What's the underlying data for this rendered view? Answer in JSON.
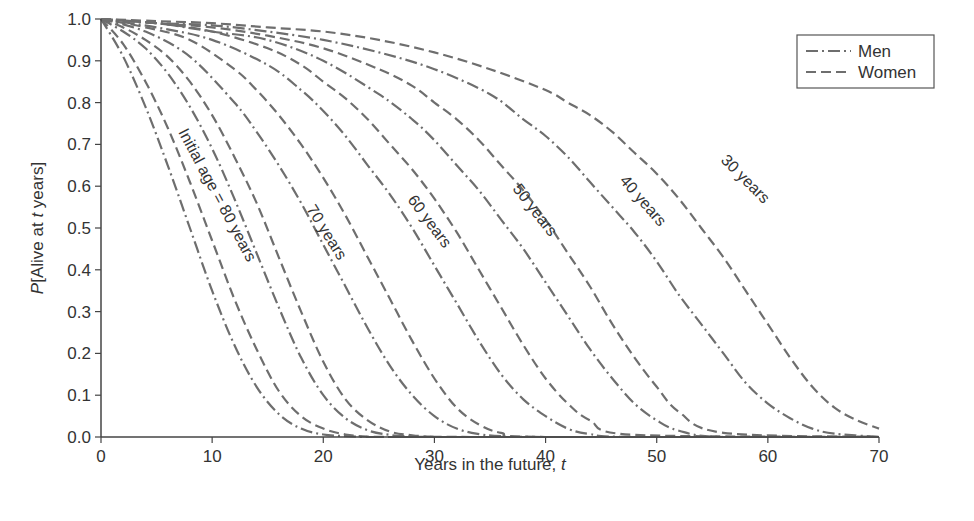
{
  "chart_data": {
    "type": "line",
    "title": "",
    "xlabel": "Years in the future, t",
    "ylabel": "P[Alive at t years]",
    "xlim": [
      0,
      70
    ],
    "ylim": [
      0,
      1.0
    ],
    "xticks": [
      0,
      10,
      20,
      30,
      40,
      50,
      60,
      70
    ],
    "yticks": [
      "0.0",
      "0.1",
      "0.2",
      "0.3",
      "0.4",
      "0.5",
      "0.6",
      "0.7",
      "0.8",
      "0.9",
      "1.0"
    ],
    "grid": false,
    "legend": {
      "position": "upper right",
      "entries": [
        {
          "label": "Men",
          "style": "dash-dot"
        },
        {
          "label": "Women",
          "style": "dashed"
        }
      ]
    },
    "line_color": "#6e6e6e",
    "series": [
      {
        "name": "Men, initial age 80",
        "sex": "Men",
        "age": 80,
        "x": [
          0,
          2,
          4,
          6,
          8,
          10,
          12,
          14,
          16,
          18,
          20,
          22,
          24,
          26,
          28,
          30
        ],
        "y": [
          1.0,
          0.91,
          0.79,
          0.65,
          0.5,
          0.35,
          0.22,
          0.12,
          0.055,
          0.02,
          0.006,
          0.002,
          0.0,
          0.0,
          0.0,
          0.0
        ]
      },
      {
        "name": "Women, initial age 80",
        "sex": "Women",
        "age": 80,
        "x": [
          0,
          2,
          4,
          6,
          8,
          10,
          12,
          14,
          16,
          18,
          20,
          22,
          24,
          26,
          28,
          30
        ],
        "y": [
          1.0,
          0.94,
          0.85,
          0.74,
          0.61,
          0.47,
          0.33,
          0.21,
          0.11,
          0.05,
          0.02,
          0.006,
          0.001,
          0.0,
          0.0,
          0.0
        ]
      },
      {
        "name": "Men, initial age 70",
        "sex": "Men",
        "age": 70,
        "x": [
          0,
          2,
          4,
          6,
          8,
          10,
          12,
          14,
          16,
          18,
          20,
          22,
          24,
          26,
          28,
          30,
          34
        ],
        "y": [
          1.0,
          0.97,
          0.93,
          0.87,
          0.79,
          0.69,
          0.57,
          0.44,
          0.31,
          0.19,
          0.1,
          0.045,
          0.016,
          0.005,
          0.001,
          0.0,
          0.0
        ]
      },
      {
        "name": "Women, initial age 70",
        "sex": "Women",
        "age": 70,
        "x": [
          0,
          2,
          4,
          6,
          8,
          10,
          12,
          14,
          16,
          18,
          20,
          22,
          24,
          26,
          28,
          30,
          34
        ],
        "y": [
          1.0,
          0.98,
          0.95,
          0.91,
          0.85,
          0.77,
          0.67,
          0.56,
          0.43,
          0.3,
          0.18,
          0.09,
          0.04,
          0.013,
          0.004,
          0.001,
          0.0
        ]
      },
      {
        "name": "Men, initial age 60",
        "sex": "Men",
        "age": 60,
        "x": [
          0,
          4,
          8,
          12,
          14,
          16,
          18,
          20,
          22,
          24,
          26,
          28,
          30,
          32,
          34,
          36,
          40
        ],
        "y": [
          1.0,
          0.97,
          0.91,
          0.8,
          0.73,
          0.65,
          0.56,
          0.46,
          0.36,
          0.26,
          0.17,
          0.1,
          0.05,
          0.02,
          0.007,
          0.002,
          0.0
        ]
      },
      {
        "name": "Women, initial age 60",
        "sex": "Women",
        "age": 60,
        "x": [
          0,
          4,
          8,
          12,
          14,
          16,
          18,
          20,
          22,
          24,
          26,
          28,
          30,
          32,
          34,
          36,
          40
        ],
        "y": [
          1.0,
          0.98,
          0.95,
          0.88,
          0.83,
          0.77,
          0.7,
          0.62,
          0.53,
          0.43,
          0.33,
          0.23,
          0.14,
          0.07,
          0.03,
          0.01,
          0.0
        ]
      },
      {
        "name": "Men, initial age 50",
        "sex": "Men",
        "age": 50,
        "x": [
          0,
          5,
          10,
          15,
          18,
          20,
          22,
          24,
          26,
          28,
          30,
          32,
          34,
          36,
          38,
          40,
          42,
          44,
          48
        ],
        "y": [
          1.0,
          0.98,
          0.95,
          0.89,
          0.83,
          0.78,
          0.72,
          0.65,
          0.58,
          0.5,
          0.41,
          0.32,
          0.23,
          0.15,
          0.09,
          0.05,
          0.02,
          0.007,
          0.0
        ]
      },
      {
        "name": "Women, initial age 50",
        "sex": "Women",
        "age": 50,
        "x": [
          0,
          5,
          10,
          15,
          18,
          20,
          22,
          24,
          26,
          28,
          30,
          32,
          34,
          36,
          38,
          40,
          42,
          44,
          48
        ],
        "y": [
          1.0,
          0.99,
          0.97,
          0.93,
          0.89,
          0.85,
          0.81,
          0.76,
          0.7,
          0.64,
          0.57,
          0.49,
          0.4,
          0.31,
          0.22,
          0.14,
          0.08,
          0.04,
          0.005
        ]
      },
      {
        "name": "Men, initial age 40",
        "sex": "Men",
        "age": 40,
        "x": [
          0,
          5,
          10,
          15,
          20,
          25,
          28,
          30,
          32,
          34,
          36,
          38,
          40,
          42,
          44,
          46,
          48,
          50,
          52,
          56
        ],
        "y": [
          1.0,
          0.99,
          0.97,
          0.95,
          0.9,
          0.82,
          0.76,
          0.71,
          0.65,
          0.59,
          0.52,
          0.45,
          0.37,
          0.29,
          0.21,
          0.14,
          0.08,
          0.04,
          0.015,
          0.0
        ]
      },
      {
        "name": "Women, initial age 40",
        "sex": "Women",
        "age": 40,
        "x": [
          0,
          5,
          10,
          15,
          20,
          25,
          28,
          30,
          32,
          34,
          36,
          38,
          40,
          42,
          44,
          46,
          48,
          50,
          52,
          56
        ],
        "y": [
          1.0,
          0.99,
          0.98,
          0.96,
          0.93,
          0.88,
          0.84,
          0.8,
          0.76,
          0.71,
          0.65,
          0.59,
          0.52,
          0.44,
          0.36,
          0.27,
          0.19,
          0.12,
          0.06,
          0.01
        ]
      },
      {
        "name": "Men, initial age 30",
        "sex": "Men",
        "age": 30,
        "x": [
          0,
          5,
          10,
          15,
          20,
          25,
          30,
          35,
          38,
          40,
          42,
          44,
          46,
          48,
          50,
          52,
          54,
          56,
          58,
          60,
          62,
          64,
          66,
          70
        ],
        "y": [
          1.0,
          0.99,
          0.985,
          0.97,
          0.95,
          0.92,
          0.88,
          0.82,
          0.76,
          0.72,
          0.67,
          0.61,
          0.55,
          0.49,
          0.42,
          0.34,
          0.27,
          0.2,
          0.13,
          0.08,
          0.045,
          0.02,
          0.008,
          0.0
        ]
      },
      {
        "name": "Women, initial age 30",
        "sex": "Women",
        "age": 30,
        "x": [
          0,
          5,
          10,
          15,
          20,
          25,
          30,
          35,
          40,
          42,
          44,
          46,
          48,
          50,
          52,
          54,
          56,
          58,
          60,
          62,
          64,
          66,
          68,
          70
        ],
        "y": [
          1.0,
          0.995,
          0.99,
          0.98,
          0.97,
          0.95,
          0.92,
          0.88,
          0.83,
          0.8,
          0.77,
          0.73,
          0.68,
          0.63,
          0.57,
          0.5,
          0.43,
          0.35,
          0.27,
          0.19,
          0.12,
          0.07,
          0.04,
          0.02
        ]
      }
    ],
    "annotations": [
      {
        "text": "Initial age = 80 years",
        "x": 178,
        "y": 132,
        "angle": 62
      },
      {
        "text": "70 years",
        "x": 306,
        "y": 209,
        "angle": 58
      },
      {
        "text": "60 years",
        "x": 407,
        "y": 200,
        "angle": 53
      },
      {
        "text": "50 years",
        "x": 512,
        "y": 189,
        "angle": 52
      },
      {
        "text": "40 years",
        "x": 619,
        "y": 181,
        "angle": 49
      },
      {
        "text": "30 years",
        "x": 720,
        "y": 161,
        "angle": 45
      }
    ]
  }
}
